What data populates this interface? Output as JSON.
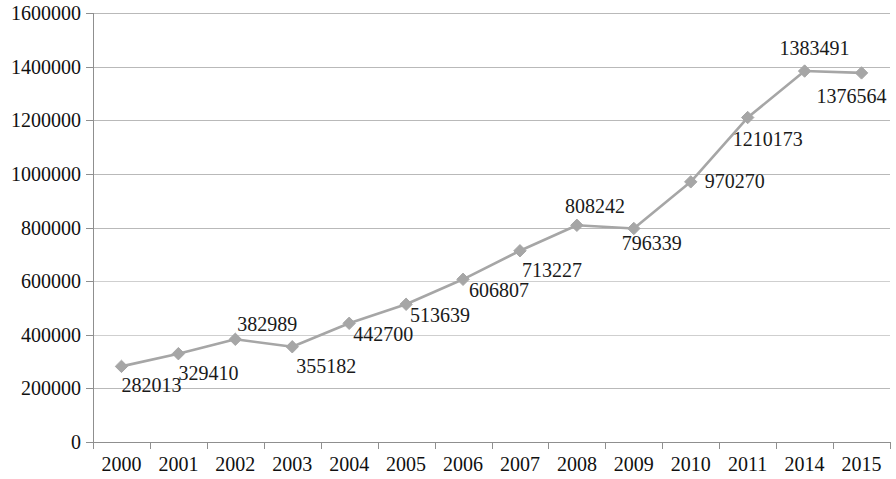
{
  "chart_data": {
    "type": "line",
    "title": "",
    "subtitle": "",
    "xlabel": "",
    "ylabel": "",
    "grid": true,
    "legend": false,
    "legend_position": "none",
    "series_color": "#a6a6a6",
    "marker_shape": "diamond",
    "show_data_labels": true,
    "categories": [
      "2000",
      "2001",
      "2002",
      "2003",
      "2004",
      "2005",
      "2006",
      "2007",
      "2008",
      "2009",
      "2010",
      "2011",
      "2014",
      "2015"
    ],
    "values": [
      282013,
      329410,
      382989,
      355182,
      442700,
      513639,
      606807,
      713227,
      808242,
      796339,
      970270,
      1210173,
      1383491,
      1376564
    ],
    "data_labels": [
      "282013",
      "329410",
      "382989",
      "355182",
      "442700",
      "513639",
      "606807",
      "713227",
      "808242",
      "796339",
      "970270",
      "1210173",
      "1383491",
      "1376564"
    ],
    "label_offsets": [
      {
        "dx": 30,
        "dy": 26
      },
      {
        "dx": 30,
        "dy": 26
      },
      {
        "dx": 32,
        "dy": -8
      },
      {
        "dx": 34,
        "dy": 26
      },
      {
        "dx": 34,
        "dy": 18
      },
      {
        "dx": 34,
        "dy": 18
      },
      {
        "dx": 36,
        "dy": 18
      },
      {
        "dx": 32,
        "dy": 26
      },
      {
        "dx": 18,
        "dy": -12
      },
      {
        "dx": 18,
        "dy": 22
      },
      {
        "dx": 44,
        "dy": 6
      },
      {
        "dx": 20,
        "dy": 28
      },
      {
        "dx": 10,
        "dy": -16
      },
      {
        "dx": -10,
        "dy": 30
      }
    ],
    "ylim": [
      0,
      1600000
    ],
    "ytick_step": 200000,
    "ytick_labels": [
      "0",
      "200000",
      "400000",
      "600000",
      "800000",
      "1000000",
      "1200000",
      "1400000",
      "1600000"
    ],
    "ytick_values": [
      0,
      200000,
      400000,
      600000,
      800000,
      1000000,
      1200000,
      1400000,
      1600000
    ]
  }
}
